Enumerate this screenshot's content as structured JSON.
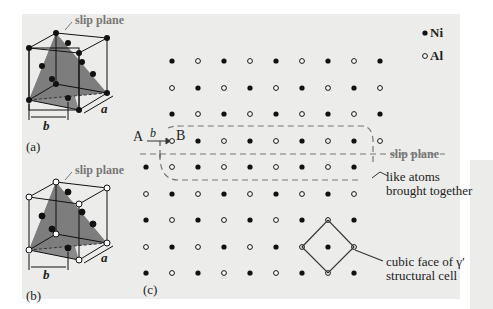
{
  "panels": {
    "a": {
      "label": "(a)",
      "slip_plane": "slip plane",
      "b": "b",
      "a": "a"
    },
    "b": {
      "label": "(b)",
      "slip_plane": "slip plane",
      "b": "b",
      "a": "a"
    },
    "c": {
      "label": "(c)"
    }
  },
  "legend": {
    "ni": "Ni",
    "al": "Al"
  },
  "lattice": {
    "A": "A",
    "B": "B",
    "b": "b",
    "slip_plane": "slip plane",
    "like_atoms_1": "like atoms",
    "like_atoms_2": "brought together",
    "cubic_1": "cubic face of γ′",
    "cubic_2": "structural cell"
  },
  "colors": {
    "panel": "#ececea",
    "plane": "#8a8a8a",
    "dash": "#777777",
    "ink": "#111111"
  }
}
